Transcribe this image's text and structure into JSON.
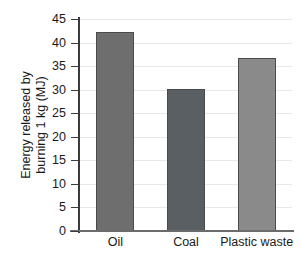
{
  "chart_data": {
    "type": "bar",
    "title": "",
    "xlabel": "",
    "ylabel": "Energy released by burning 1 kg (MJ)",
    "ylabel_lines": [
      "Energy released by",
      "burning 1 kg (MJ)"
    ],
    "categories": [
      "Oil",
      "Coal",
      "Plastic waste"
    ],
    "values": [
      42.3,
      30.1,
      36.7
    ],
    "series": [
      {
        "name": "Energy released",
        "values": [
          42.3,
          30.1,
          36.7
        ]
      }
    ],
    "bar_colors": [
      "#6e6e6e",
      "#5a5f63",
      "#8a8a8a"
    ],
    "ylim": [
      0,
      45
    ],
    "yticks": [
      0,
      5,
      10,
      15,
      20,
      25,
      30,
      35,
      40,
      45
    ],
    "ytick_labels": [
      "0",
      "5",
      "10",
      "15",
      "20",
      "25",
      "30",
      "35",
      "40",
      "45"
    ],
    "grid": true,
    "grid_axis": "y",
    "grid_color": "#e8e8e8",
    "legend": false,
    "axis_color": "#3b3b3b",
    "background": "#ffffff"
  }
}
